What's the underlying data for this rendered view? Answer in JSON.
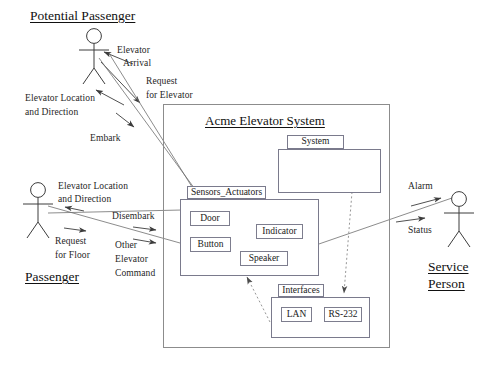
{
  "diagram": {
    "system_boundary_title": "Acme Elevator System",
    "actors": [
      {
        "name": "Potential Passenger"
      },
      {
        "name": "Passenger"
      },
      {
        "name": "Service Person",
        "line1": "Service",
        "line2": "Person"
      }
    ],
    "packages": [
      {
        "id": "system",
        "label": "System",
        "children": []
      },
      {
        "id": "sensors_actuators",
        "label": "Sensors_Actuators",
        "children": [
          "Door",
          "Button",
          "Indicator",
          "Speaker"
        ]
      },
      {
        "id": "interfaces",
        "label": "Interfaces",
        "children": [
          "LAN",
          "RS-232"
        ]
      }
    ],
    "classes": {
      "door": "Door",
      "button": "Button",
      "indicator": "Indicator",
      "speaker": "Speaker",
      "lan": "LAN",
      "rs232": "RS-232"
    },
    "flow_labels": {
      "elevator_arrival_l1": "Elevator",
      "elevator_arrival_l2": "Arrival",
      "request_for_elevator_l1": "Request",
      "request_for_elevator_l2": "for Elevator",
      "elevator_location_top_l1": "Elevator Location",
      "elevator_location_top_l2": "and Direction",
      "embark": "Embark",
      "elevator_location_mid_l1": "Elevator Location",
      "elevator_location_mid_l2": "and Direction",
      "disembark": "Disembark",
      "request_for_floor_l1": "Request",
      "request_for_floor_l2": "for Floor",
      "other_elevator_command_l1": "Other",
      "other_elevator_command_l2": "Elevator",
      "other_elevator_command_l3": "Command",
      "alarm": "Alarm",
      "status": "Status"
    },
    "colors": {
      "stroke": "#4a4a4a",
      "package_border": "#7a7a8c",
      "boundary_border": "#8c8c8c",
      "text": "#1a1a1a",
      "background": "#ffffff"
    }
  }
}
